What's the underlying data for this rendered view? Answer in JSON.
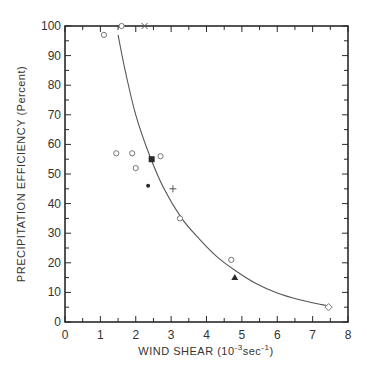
{
  "chart_data": {
    "type": "scatter",
    "title": "",
    "xlabel": "WIND SHEAR  (10⁻³sec⁻¹)",
    "ylabel": "PRECIPITATION  EFFICIENCY  (Percent)",
    "xlim": [
      0,
      8
    ],
    "ylim": [
      0,
      100
    ],
    "x_ticks": [
      0,
      1,
      2,
      3,
      4,
      5,
      6,
      7,
      8
    ],
    "y_ticks": [
      0,
      10,
      20,
      30,
      40,
      50,
      60,
      70,
      80,
      90,
      100
    ],
    "x_minor_step": 0.5,
    "y_minor_step": 5,
    "grid": false,
    "legend": null,
    "series": [
      {
        "name": "open-circle",
        "marker": "circle-open",
        "points": [
          [
            1.1,
            97
          ],
          [
            1.6,
            100
          ],
          [
            1.45,
            57
          ],
          [
            1.9,
            57
          ],
          [
            2.0,
            52
          ],
          [
            2.7,
            56
          ],
          [
            3.25,
            35
          ],
          [
            4.7,
            21
          ]
        ]
      },
      {
        "name": "x-mark",
        "marker": "x",
        "points": [
          [
            2.25,
            100
          ]
        ]
      },
      {
        "name": "filled-square",
        "marker": "square-filled",
        "points": [
          [
            2.45,
            55
          ]
        ]
      },
      {
        "name": "filled-dot",
        "marker": "dot-filled",
        "points": [
          [
            2.35,
            46
          ]
        ]
      },
      {
        "name": "plus",
        "marker": "plus",
        "points": [
          [
            3.05,
            45
          ]
        ]
      },
      {
        "name": "filled-triangle",
        "marker": "triangle-filled",
        "points": [
          [
            4.8,
            15
          ]
        ]
      },
      {
        "name": "open-diamond",
        "marker": "diamond-open",
        "points": [
          [
            7.45,
            5
          ]
        ]
      }
    ],
    "fit_curve": {
      "name": "fitted-curve",
      "points": [
        [
          1.5,
          97
        ],
        [
          1.7,
          85
        ],
        [
          2.0,
          70
        ],
        [
          2.4,
          56
        ],
        [
          2.8,
          45
        ],
        [
          3.3,
          35
        ],
        [
          3.8,
          28
        ],
        [
          4.3,
          22
        ],
        [
          4.8,
          17.5
        ],
        [
          5.4,
          13
        ],
        [
          6.0,
          9.8
        ],
        [
          6.6,
          7.6
        ],
        [
          7.2,
          6
        ],
        [
          7.4,
          5.6
        ]
      ]
    }
  },
  "axes": {
    "x_title_main": "WIND  SHEAR  (10",
    "x_title_sup1": "-3",
    "x_title_mid": "sec",
    "x_title_sup2": "-1",
    "x_title_end": ")",
    "y_title": "PRECIPITATION  EFFICIENCY  (Percent)"
  },
  "colors": {
    "ink": "#2a2a2a",
    "curve": "#555555",
    "background": "#ffffff"
  }
}
